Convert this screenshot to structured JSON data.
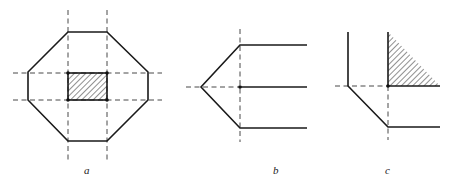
{
  "figure": {
    "panels": [
      {
        "id": "a",
        "label": "a",
        "description": "Octagon with dashed grid lines and hatched central rectangle"
      },
      {
        "id": "b",
        "label": "b",
        "description": "Three horizontal lines with a left-pointing wedge apex on a dashed axis"
      },
      {
        "id": "c",
        "label": "c",
        "description": "Corner with hatched triangular region and angled lower segment"
      }
    ],
    "colors": {
      "stroke": "#1a1a1a",
      "dash": "#333333",
      "background": "#ffffff"
    }
  }
}
